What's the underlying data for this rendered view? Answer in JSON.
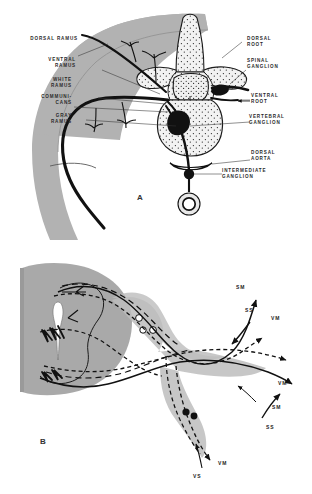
{
  "figure": {
    "panels": [
      {
        "letter": "A",
        "caption_letter": "A",
        "labels_left": [
          {
            "id": "dorsal-ramus",
            "text": "DORSAL RAMUS"
          },
          {
            "id": "ventral-ramus",
            "text": "VENTRAL\nRAMUS"
          },
          {
            "id": "white-ramus",
            "text": "WHITE\nRAMUS"
          },
          {
            "id": "communicans",
            "text": "COMMUNI-\nCANS"
          },
          {
            "id": "gray-ramus",
            "text": "GRAY\nRAMUS"
          }
        ],
        "labels_right": [
          {
            "id": "dorsal-root",
            "text": "DORSAL\nROOT"
          },
          {
            "id": "spinal-ganglion",
            "text": "SPINAL\nGANGLION"
          },
          {
            "id": "ventral-root",
            "text": "VENTRAL\nROOT"
          },
          {
            "id": "vertebral-ganglion",
            "text": "VERTEBRAL\nGANGLION"
          },
          {
            "id": "dorsal-aorta",
            "text": "DORSAL\nAORTA"
          },
          {
            "id": "intermediate-ganglion",
            "text": "INTERMEDIATE\nGANGLION"
          }
        ]
      },
      {
        "letter": "B",
        "caption_letter": "B",
        "nerve_labels": [
          {
            "id": "sm-upper",
            "text": "SM"
          },
          {
            "id": "ss-upper",
            "text": "SS"
          },
          {
            "id": "vm-upper",
            "text": "VM"
          },
          {
            "id": "vm-mid",
            "text": "VM"
          },
          {
            "id": "sm-mid",
            "text": "SM"
          },
          {
            "id": "ss-mid",
            "text": "SS"
          },
          {
            "id": "vm-lower",
            "text": "VM"
          },
          {
            "id": "vs-lower",
            "text": "VS"
          }
        ]
      }
    ],
    "colors": {
      "tissue_gray": "#b2b2b2",
      "tissue_gray_b": "#a9a9a9",
      "nerve_black": "#111111",
      "stipple": "#2b2b2b",
      "background": "#ffffff",
      "label_text": "#2a2a2a"
    }
  }
}
